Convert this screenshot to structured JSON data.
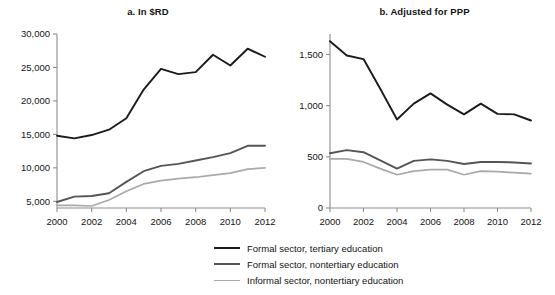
{
  "figure": {
    "background_color": "#ffffff",
    "series_colors": [
      "#1b1b1b",
      "#555555",
      "#a9a9a9"
    ]
  },
  "legend": {
    "position": "bottom-center",
    "entries": [
      "Formal sector, tertiary education",
      "Formal sector, nontertiary education",
      "Informal sector, nontertiary education"
    ]
  },
  "panel_a": {
    "title": "a. In $RD",
    "ytick_labels": [
      "5,000",
      "10,000",
      "15,000",
      "20,000",
      "25,000",
      "30,000"
    ],
    "xtick_labels": [
      "2000",
      "2002",
      "2004",
      "2006",
      "2008",
      "2010",
      "2012"
    ]
  },
  "panel_b": {
    "title": "b. Adjusted for PPP",
    "ytick_labels": [
      "0",
      "500",
      "1,000",
      "1,500"
    ],
    "xtick_labels": [
      "2000",
      "2002",
      "2004",
      "2006",
      "2008",
      "2010",
      "2012"
    ]
  },
  "chart_data": [
    {
      "type": "line",
      "title": "a. In $RD",
      "xlabel": "",
      "ylabel": "",
      "x": [
        2000,
        2001,
        2002,
        2003,
        2004,
        2005,
        2006,
        2007,
        2008,
        2009,
        2010,
        2011,
        2012
      ],
      "xlim": [
        2000,
        2012
      ],
      "ylim": [
        4000,
        30000
      ],
      "yticks": [
        5000,
        10000,
        15000,
        20000,
        25000,
        30000
      ],
      "xticks": [
        2000,
        2002,
        2004,
        2006,
        2008,
        2010,
        2012
      ],
      "grid": false,
      "legend_position": "bottom-center",
      "series": [
        {
          "name": "Formal sector, tertiary education",
          "color": "#1b1b1b",
          "values": [
            14800,
            14400,
            14900,
            15700,
            17400,
            21700,
            24800,
            24000,
            24300,
            26900,
            25300,
            27800,
            26600
          ]
        },
        {
          "name": "Formal sector, nontertiary education",
          "color": "#555555",
          "values": [
            4900,
            5700,
            5800,
            6200,
            7900,
            9500,
            10300,
            10600,
            11100,
            11600,
            12200,
            13300,
            13300
          ]
        },
        {
          "name": "Informal sector, nontertiary education",
          "color": "#a9a9a9",
          "values": [
            4400,
            4400,
            4300,
            5200,
            6500,
            7600,
            8100,
            8400,
            8600,
            8900,
            9200,
            9800,
            10000
          ]
        }
      ]
    },
    {
      "type": "line",
      "title": "b. Adjusted for PPP",
      "xlabel": "",
      "ylabel": "",
      "x": [
        2000,
        2001,
        2002,
        2003,
        2004,
        2005,
        2006,
        2007,
        2008,
        2009,
        2010,
        2011,
        2012
      ],
      "xlim": [
        2000,
        2012
      ],
      "ylim": [
        0,
        1700
      ],
      "yticks": [
        0,
        500,
        1000,
        1500
      ],
      "xticks": [
        2000,
        2002,
        2004,
        2006,
        2008,
        2010,
        2012
      ],
      "grid": false,
      "legend_position": "bottom-center",
      "series": [
        {
          "name": "Formal sector, tertiary education",
          "color": "#1b1b1b",
          "values": [
            1630,
            1490,
            1455,
            1165,
            865,
            1020,
            1120,
            1010,
            915,
            1020,
            920,
            915,
            855
          ]
        },
        {
          "name": "Formal sector, nontertiary education",
          "color": "#555555",
          "values": [
            535,
            565,
            545,
            465,
            385,
            460,
            475,
            460,
            430,
            450,
            450,
            445,
            435
          ]
        },
        {
          "name": "Informal sector, nontertiary education",
          "color": "#a9a9a9",
          "values": [
            480,
            480,
            450,
            385,
            325,
            360,
            375,
            375,
            325,
            360,
            355,
            345,
            335
          ]
        }
      ]
    }
  ]
}
